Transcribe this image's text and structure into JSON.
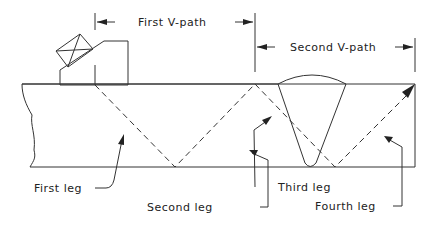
{
  "diagram": {
    "type": "ultrasonic weld inspection beam path",
    "dimensions": {
      "first_v_path": "First V-path",
      "second_v_path": "Second V-path"
    },
    "legs": {
      "first": "First leg",
      "second": "Second leg",
      "third": "Third leg",
      "fourth": "Fourth leg"
    },
    "colors": {
      "line": "#333333",
      "background": "#ffffff"
    }
  }
}
